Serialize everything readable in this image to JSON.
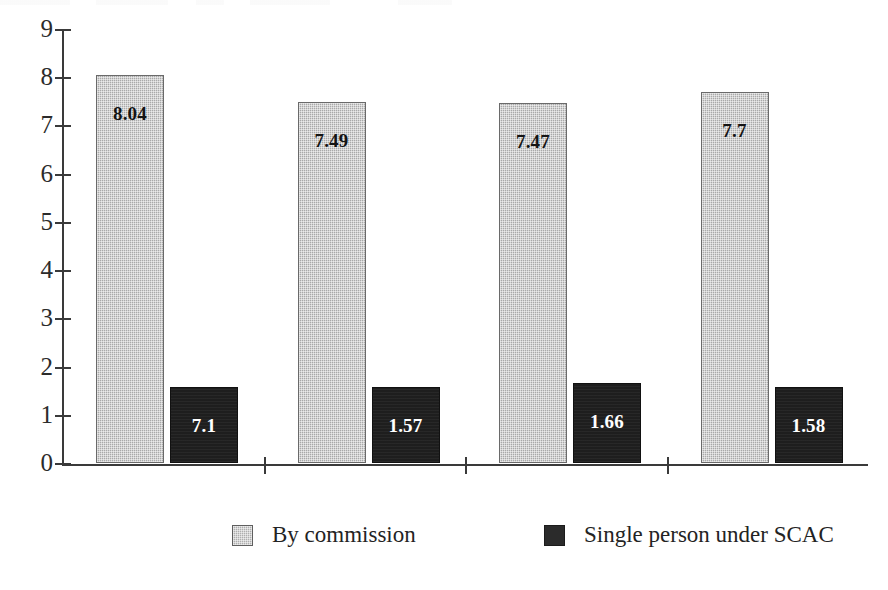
{
  "chart_data": {
    "type": "bar",
    "title": "",
    "subtitle": "",
    "xlabel": "",
    "ylabel": "",
    "categories": [
      "",
      "",
      "",
      ""
    ],
    "series": [
      {
        "name": "By commission",
        "color": "#a9a9a9",
        "values": [
          8.04,
          7.49,
          7.47,
          7.7
        ],
        "labels": [
          "8.04",
          "7.49",
          "7.47",
          "7.7"
        ]
      },
      {
        "name": "Single person under SCAC",
        "color": "#1e1e1e",
        "values": [
          1.57,
          1.57,
          1.66,
          1.58
        ],
        "labels": [
          "7.1",
          "1.57",
          "1.66",
          "1.58"
        ]
      }
    ],
    "ylim": [
      0,
      9
    ],
    "ytick_labels": [
      "0",
      "1",
      "2",
      "3",
      "4",
      "5",
      "6",
      "7",
      "8",
      "9"
    ],
    "ytick_values": [
      0,
      1,
      2,
      3,
      4,
      5,
      6,
      7,
      8,
      9
    ],
    "grid": false,
    "legend_position": "bottom"
  },
  "legend": {
    "items": [
      {
        "label": "By commission",
        "swatch": "light-gray-swatch"
      },
      {
        "label": "Single person under SCAC",
        "swatch": "dark-swatch"
      }
    ]
  }
}
